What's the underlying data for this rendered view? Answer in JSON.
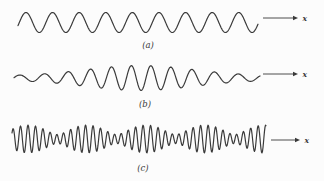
{
  "diagram": {
    "background_color": "#fcfcfc",
    "line_color": "#3a3a3a"
  },
  "waves": [
    {
      "caption": "(a)",
      "axis_label": "x",
      "type": "sine",
      "x_start": 18,
      "x_end": 258,
      "midline_y": 22.5,
      "amplitude": 10,
      "wavelength": 26.6,
      "phase_deg": -18,
      "arrow": {
        "x_start": 263,
        "x_tip": 298,
        "y": 18
      },
      "caption_pos": {
        "x": 148,
        "y": 48
      },
      "axis_label_pos": {
        "x": 302.5,
        "y": 20.5
      }
    },
    {
      "caption": "(b)",
      "axis_label": "x",
      "type": "packet",
      "x_start": 14,
      "x_end": 260,
      "midline_y": 78,
      "amp_base": 2.2,
      "amp_peak": 10.3,
      "packet_center": 140,
      "packet_sigma": 75,
      "wavelength": 19.5,
      "edge_wavelength_add": 6,
      "arrow": {
        "x_start": 263,
        "x_tip": 298,
        "y": 74
      },
      "caption_pos": {
        "x": 145,
        "y": 107
      },
      "axis_label_pos": {
        "x": 302.5,
        "y": 76.5
      }
    },
    {
      "caption": "(c)",
      "axis_label": "x",
      "type": "beats",
      "x_start": 12,
      "x_end": 266,
      "midline_y": 139,
      "component1": {
        "amplitude": 9.3,
        "wavelength": 7.2
      },
      "component2": {
        "amplitude": 4.7,
        "wavelength": 8.2
      },
      "beat_center": 28,
      "arrow": {
        "x_start": 271,
        "x_tip": 300,
        "y": 140
      },
      "caption_pos": {
        "x": 143,
        "y": 171
      },
      "axis_label_pos": {
        "x": 304.5,
        "y": 142.5
      }
    }
  ]
}
